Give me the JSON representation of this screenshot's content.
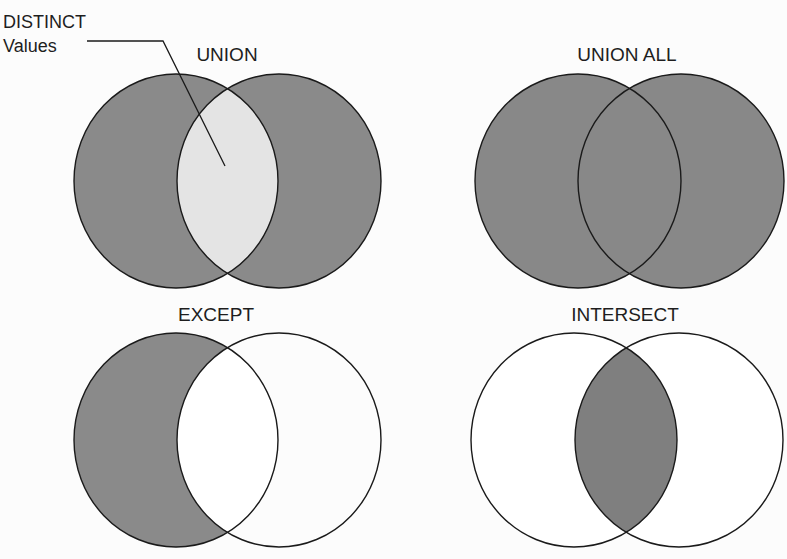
{
  "diagram": {
    "colors": {
      "background": "#fcfcfc",
      "shaded": "#8a8a8a",
      "shaded_dark": "#7f7f7f",
      "distinct_highlight": "#e4e4e4",
      "unshaded": "#ffffff",
      "stroke": "#1a1a1a"
    },
    "callout": {
      "line1": "DISTINCT",
      "line2": "Values",
      "points_to": "UNION overlap region"
    },
    "panels": [
      {
        "id": "union",
        "label": "UNION",
        "left_set": "shaded",
        "right_set": "shaded",
        "overlap": "light (distinct values)"
      },
      {
        "id": "union-all",
        "label": "UNION ALL",
        "left_set": "shaded",
        "right_set": "shaded",
        "overlap": "shaded"
      },
      {
        "id": "except",
        "label": "EXCEPT",
        "left_set": "shaded",
        "right_set": "unshaded",
        "overlap": "unshaded"
      },
      {
        "id": "intersect",
        "label": "INTERSECT",
        "left_set": "unshaded",
        "right_set": "unshaded",
        "overlap": "shaded"
      }
    ]
  }
}
